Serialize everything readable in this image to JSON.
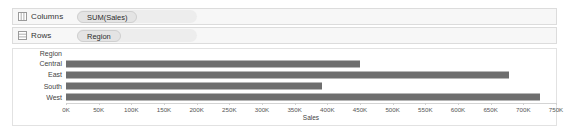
{
  "shelves": [
    {
      "name": "columns",
      "label": "Columns",
      "icon": "columns-grid-icon",
      "pill": "SUM(Sales)"
    },
    {
      "name": "rows",
      "label": "Rows",
      "icon": "rows-grid-icon",
      "pill": "Region"
    }
  ],
  "chart_data": {
    "type": "bar",
    "orientation": "horizontal",
    "title": "",
    "xlabel": "Sales",
    "ylabel": "Region",
    "row_header": "Region",
    "categories": [
      "Central",
      "East",
      "South",
      "West"
    ],
    "values": [
      450000,
      678000,
      392000,
      725000
    ],
    "xlim": [
      0,
      750000
    ],
    "tick_values": [
      0,
      50000,
      100000,
      150000,
      200000,
      250000,
      300000,
      350000,
      400000,
      450000,
      500000,
      550000,
      600000,
      650000,
      700000,
      750000
    ],
    "tick_labels": [
      "0K",
      "50K",
      "100K",
      "150K",
      "200K",
      "250K",
      "300K",
      "350K",
      "400K",
      "450K",
      "500K",
      "550K",
      "600K",
      "650K",
      "700K",
      "750K"
    ],
    "grid": false,
    "legend": "none",
    "bar_color": "#6e6e6e"
  }
}
